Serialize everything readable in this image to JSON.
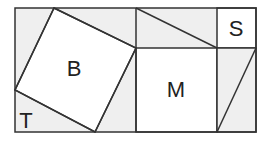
{
  "colors": {
    "background": "#ffffff",
    "shaded_region": "#efefef",
    "line": "#333333",
    "label": "#222222"
  },
  "labels": {
    "big_square": "B",
    "medium_square": "M",
    "small_square": "S",
    "triangle": "T"
  }
}
